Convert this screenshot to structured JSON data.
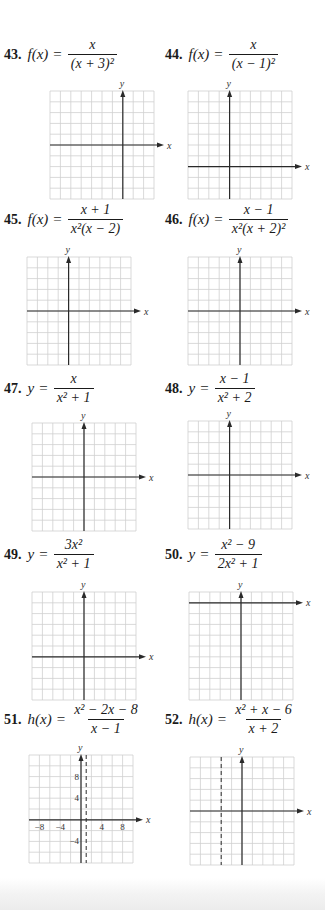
{
  "page": {
    "background": "#ffffff",
    "grid_color": "#cfcfcf",
    "axis_color": "#2a2a2a"
  },
  "problems": [
    {
      "number": "43.",
      "lhs": "f(x)",
      "equals": "=",
      "numerator": "x",
      "denominator": "(x + 3)²",
      "graph": {
        "x_label": "x",
        "y_label": "y",
        "cols": 10,
        "rows": 10,
        "y_axis_col": 7,
        "x_axis_row": 5
      }
    },
    {
      "number": "44.",
      "lhs": "f(x)",
      "equals": "=",
      "numerator": "x",
      "denominator": "(x − 1)²",
      "graph": {
        "x_label": "x",
        "y_label": "y",
        "cols": 10,
        "rows": 10,
        "y_axis_col": 4,
        "x_axis_row": 7
      }
    },
    {
      "number": "45.",
      "lhs": "f(x)",
      "equals": "=",
      "numerator": "x + 1",
      "denominator": "x²(x − 2)",
      "graph": {
        "x_label": "x",
        "y_label": "y",
        "cols": 10,
        "rows": 10,
        "y_axis_col": 4,
        "x_axis_row": 5
      }
    },
    {
      "number": "46.",
      "lhs": "f(x)",
      "equals": "=",
      "numerator": "x − 1",
      "denominator": "x²(x + 2)²",
      "graph": {
        "x_label": "x",
        "y_label": "y",
        "cols": 10,
        "rows": 10,
        "y_axis_col": 5,
        "x_axis_row": 5
      }
    },
    {
      "number": "47.",
      "lhs": "y",
      "equals": "=",
      "numerator": "x",
      "denominator": "x² + 1",
      "graph": {
        "x_label": "x",
        "y_label": "y",
        "cols": 10,
        "rows": 10,
        "y_axis_col": 5,
        "x_axis_row": 5
      }
    },
    {
      "number": "48.",
      "lhs": "y",
      "equals": "=",
      "numerator": "x − 1",
      "denominator": "x² + 2",
      "graph": {
        "x_label": "x",
        "y_label": "y",
        "cols": 10,
        "rows": 10,
        "y_axis_col": 4,
        "x_axis_row": 5
      }
    },
    {
      "number": "49.",
      "lhs": "y",
      "equals": "=",
      "numerator": "3x²",
      "denominator": "x² + 1",
      "graph": {
        "x_label": "x",
        "y_label": "y",
        "cols": 10,
        "rows": 10,
        "y_axis_col": 5,
        "x_axis_row": 6
      }
    },
    {
      "number": "50.",
      "lhs": "y",
      "equals": "=",
      "numerator": "x² − 9",
      "denominator": "2x² + 1",
      "graph": {
        "x_label": "x",
        "y_label": "y",
        "cols": 10,
        "rows": 10,
        "y_axis_col": 5,
        "x_axis_row": 1
      }
    },
    {
      "number": "51.",
      "lhs": "h(x)",
      "equals": "=",
      "numerator": "x² − 2x − 8",
      "denominator": "x − 1",
      "graph": {
        "x_label": "x",
        "y_label": "y",
        "cols": 10,
        "rows": 10,
        "y_axis_col": 5,
        "x_axis_row": 6,
        "dashed_col": 5.5,
        "x_ticks": [
          {
            "col": 1,
            "label": "−8"
          },
          {
            "col": 3,
            "label": "−4"
          },
          {
            "col": 7,
            "label": "4"
          },
          {
            "col": 9,
            "label": "8"
          }
        ],
        "y_ticks": [
          {
            "row": 2,
            "label": "8"
          },
          {
            "row": 4,
            "label": "4"
          },
          {
            "row": 8,
            "label": "−4"
          }
        ]
      }
    },
    {
      "number": "52.",
      "lhs": "h(x)",
      "equals": "=",
      "numerator": "x² + x − 6",
      "denominator": "x + 2",
      "graph": {
        "x_label": "x",
        "y_label": "y",
        "cols": 10,
        "rows": 10,
        "y_axis_col": 5,
        "x_axis_row": 5,
        "dashed_col": 3
      }
    }
  ]
}
